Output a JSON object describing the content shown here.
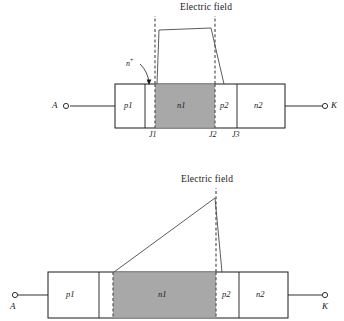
{
  "figure": {
    "type": "semiconductor-device-cross-section",
    "colors": {
      "outline": "#1a1a1a",
      "shaded_region_fill": "#a8a8a8",
      "field_line": "#4a4a4a",
      "dashed_junction": "#555555",
      "background": "#ffffff"
    }
  },
  "panels": [
    {
      "id": "top",
      "field_label": "Electric field",
      "field_profile": "trapezoid",
      "field_note": "punch-through: field extends across n1 and is truncated at the n+ buffer layer",
      "buffer_label": "n",
      "buffer_superscript": "+",
      "has_buffer_layer": true,
      "terminals": [
        {
          "name": "A",
          "side": "left"
        },
        {
          "name": "K",
          "side": "right"
        }
      ],
      "layers": [
        {
          "label": "p1",
          "shaded": false
        },
        {
          "label": "",
          "shaded": false
        },
        {
          "label": "n1",
          "shaded": true
        },
        {
          "label": "p2",
          "shaded": false
        },
        {
          "label": "n2",
          "shaded": false
        }
      ],
      "junctions": [
        "J1",
        "J2",
        "J3"
      ]
    },
    {
      "id": "bottom",
      "field_label": "Electric field",
      "field_profile": "triangle",
      "field_note": "non punch-through: field decreases linearly from J2 and reaches zero inside n1",
      "has_buffer_layer": false,
      "terminals": [
        {
          "name": "A",
          "side": "left"
        },
        {
          "name": "K",
          "side": "right"
        }
      ],
      "layers": [
        {
          "label": "p1",
          "shaded": false
        },
        {
          "label": "",
          "shaded": false
        },
        {
          "label": "n1",
          "shaded": true
        },
        {
          "label": "p2",
          "shaded": false
        },
        {
          "label": "n2",
          "shaded": false
        }
      ],
      "junctions": [
        "J1",
        "J2",
        "J3"
      ]
    }
  ]
}
